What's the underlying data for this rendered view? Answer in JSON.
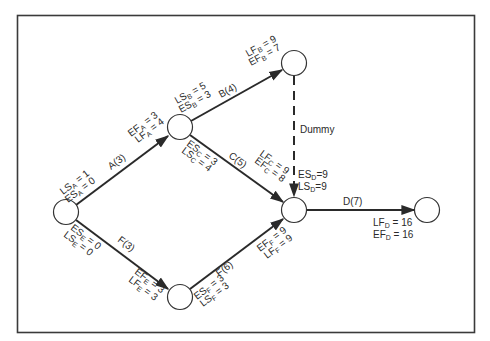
{
  "diagram": {
    "type": "activity-on-arrow network (CPM)",
    "nodes": [
      {
        "id": "n1",
        "cx": 66,
        "cy": 212
      },
      {
        "id": "n2",
        "cx": 180,
        "cy": 127
      },
      {
        "id": "n3",
        "cx": 294,
        "cy": 63
      },
      {
        "id": "n4",
        "cx": 294,
        "cy": 210
      },
      {
        "id": "n5",
        "cx": 180,
        "cy": 297
      },
      {
        "id": "n6",
        "cx": 427,
        "cy": 210
      }
    ],
    "activities": [
      {
        "name": "A",
        "duration": 3,
        "label": "A(3)",
        "from": "n1",
        "to": "n2"
      },
      {
        "name": "B",
        "duration": 4,
        "label": "B(4)",
        "from": "n2",
        "to": "n3"
      },
      {
        "name": "C",
        "duration": 5,
        "label": "C(5)",
        "from": "n2",
        "to": "n4"
      },
      {
        "name": "Dummy",
        "label": "Dummy",
        "from": "n3",
        "to": "n4",
        "dashed": true
      },
      {
        "name": "D",
        "duration": 7,
        "label": "D(7)",
        "from": "n4",
        "to": "n6"
      },
      {
        "name": "E",
        "duration": 3,
        "label": "F(3)",
        "from": "n1",
        "to": "n5"
      },
      {
        "name": "F",
        "duration": 6,
        "label": "F(6)",
        "from": "n5",
        "to": "n4"
      }
    ],
    "labels": {
      "a_label": "A(3)",
      "b_label": "B(4)",
      "c_label": "C(5)",
      "d_label": "D(7)",
      "e_label": "F(3)",
      "f_label": "F(6)",
      "dummy_label": "Dummy",
      "lsa": {
        "main": "LS",
        "sub": "A",
        "val": " = 1"
      },
      "esa": {
        "main": "ES",
        "sub": "A",
        "val": " = 0"
      },
      "efa": {
        "main": "EF",
        "sub": "A",
        "val": " = 3"
      },
      "lfa": {
        "main": "LF",
        "sub": "A",
        "val": " = 4"
      },
      "lsb": {
        "main": "LS",
        "sub": "B",
        "val": " = 5"
      },
      "esb": {
        "main": "ES",
        "sub": "B",
        "val": " = 3"
      },
      "lfb": {
        "main": "LF",
        "sub": "B",
        "val": " = 9"
      },
      "efb": {
        "main": "EF",
        "sub": "B",
        "val": " = 7"
      },
      "esc": {
        "main": "ES",
        "sub": "C",
        "val": " = 3"
      },
      "lsc": {
        "main": "LS",
        "sub": "C",
        "val": " = 4"
      },
      "lfc": {
        "main": "LF",
        "sub": "C",
        "val": " = 9"
      },
      "efc": {
        "main": "EF",
        "sub": "C",
        "val": " = 8"
      },
      "esd": {
        "main": "ES",
        "sub": "D",
        "val": "=9"
      },
      "lsd": {
        "main": "LS",
        "sub": "D",
        "val": "=9"
      },
      "lfd": {
        "main": "LF",
        "sub": "D",
        "val": " = 16"
      },
      "efd": {
        "main": "EF",
        "sub": "D",
        "val": " = 16"
      },
      "ese": {
        "main": "ES",
        "sub": "E",
        "val": " = 0"
      },
      "lse": {
        "main": "LS",
        "sub": "E",
        "val": " = 0"
      },
      "efe": {
        "main": "EF",
        "sub": "E",
        "val": " = 3"
      },
      "lfe": {
        "main": "LF",
        "sub": "E",
        "val": " = 3"
      },
      "esf": {
        "main": "ES",
        "sub": "F",
        "val": " = 3"
      },
      "lsf": {
        "main": "LS",
        "sub": "F",
        "val": " = 3"
      },
      "eff": {
        "main": "EF",
        "sub": "F",
        "val": " = 9"
      },
      "lff": {
        "main": "LF",
        "sub": "F",
        "val": " = 9"
      }
    },
    "colors": {
      "line": "#2a2a2a",
      "frame": "#3a3a3a",
      "background": "#ffffff"
    }
  }
}
